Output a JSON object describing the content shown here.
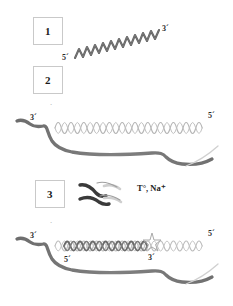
{
  "figure": {
    "title": "",
    "background_color": "#ffffff",
    "width": 233,
    "height": 306
  },
  "palette": {
    "strand_dark": "#5d5d5d",
    "strand_mid": "#7a7a7a",
    "helix_light": "#b9b9b9",
    "helix_duplex": "#6f6f6f",
    "box_border": "#c9c9c9",
    "text": "#1a1a1a",
    "faint": "#bdbdbd"
  },
  "steps": [
    {
      "id": "1",
      "label": "1"
    },
    {
      "id": "2",
      "label": "2"
    },
    {
      "id": "3",
      "label": "3"
    }
  ],
  "panel_1": {
    "name": "probe-oligonucleotide",
    "five_prime_label": "5´",
    "three_prime_label": "3´",
    "orientation": "diagonal"
  },
  "panel_2": {
    "name": "target-strand-with-probe",
    "left_end_label": "3´",
    "right_end_label": "5´"
  },
  "panel_3": {
    "name": "annealed-duplex",
    "condition_label": "T°, Na⁺",
    "icon": "annealing-ribbons-icon",
    "left_end_label": "3´",
    "right_end_label": "5´",
    "duplex_five_label": "5´",
    "duplex_three_label": "3´",
    "junction_marker": "star-marker"
  },
  "marks": {
    "faint_tick": "´"
  }
}
